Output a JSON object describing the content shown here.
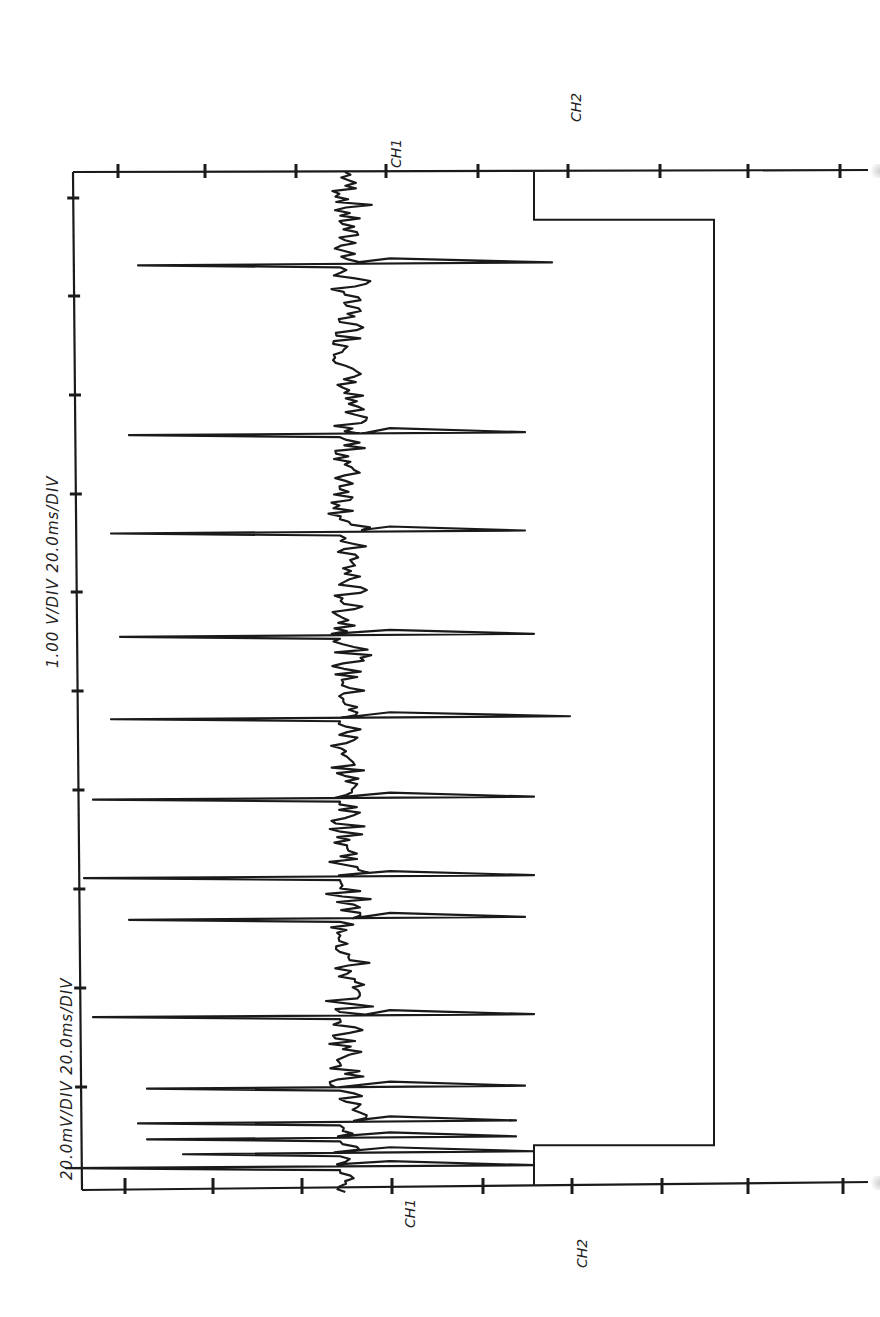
{
  "chart_data": {
    "type": "line",
    "title": "",
    "orientation": "rotated-90-ccw (time axis runs top to bottom)",
    "settings": [
      {
        "label": "20.0mV/DIV 20.0ms/DIV",
        "channel": "CH1",
        "volts_per_div": "20.0mV",
        "time_per_div": "20.0ms"
      },
      {
        "label": "1.00 V/DIV 20.0ms/DIV",
        "channel": "CH2",
        "volts_per_div": "1.00 V",
        "time_per_div": "20.0ms"
      }
    ],
    "channel_markers": {
      "top": [
        "CH1",
        "CH2"
      ],
      "bottom": [
        "CH1",
        "CH2"
      ]
    },
    "grid": false,
    "time_divisions": 10,
    "time_range_ms": [
      0,
      200
    ],
    "amplitude_divisions": 9,
    "series": [
      {
        "name": "CH1",
        "description": "Noisy baseline with repeated large biphasic spikes (bursts)",
        "baseline_division": 3.5,
        "spike_times_ms": [
          18.6,
          52.8,
          72.6,
          93.4,
          110.0,
          126.2,
          142.0,
          150.4,
          170.0,
          184.4,
          191.4,
          194.6,
          197.6,
          200.4
        ],
        "spike_min_div": [
          1.2,
          1.1,
          0.9,
          1.0,
          0.9,
          0.7,
          0.6,
          1.1,
          0.7,
          1.3,
          1.2,
          1.3,
          1.7,
          0.4
        ],
        "spike_max_div": [
          5.8,
          5.5,
          5.5,
          5.6,
          6.0,
          5.6,
          5.6,
          5.5,
          5.6,
          5.5,
          5.4,
          5.4,
          5.6,
          5.6
        ]
      },
      {
        "name": "CH2",
        "description": "Gate/trigger step signal",
        "levels_div": {
          "low": 5.6,
          "high": 7.6
        },
        "points": [
          {
            "t_ms": 0,
            "div": 5.6
          },
          {
            "t_ms": 9.6,
            "div": 5.6
          },
          {
            "t_ms": 9.6,
            "div": 7.6
          },
          {
            "t_ms": 196.0,
            "div": 7.6
          },
          {
            "t_ms": 196.0,
            "div": 5.6
          },
          {
            "t_ms": 204.0,
            "div": 5.6
          }
        ]
      }
    ]
  },
  "labels": {
    "ch1_setting": "20.0mV/DIV 20.0ms/DIV",
    "ch2_setting": "1.00 V/DIV 20.0ms/DIV",
    "ch1_top": "CH1",
    "ch2_top": "CH2",
    "ch1_bottom": "CH1",
    "ch2_bottom": "CH2"
  },
  "colors": {
    "ink": "#1a1a1a",
    "paper": "#ffffff"
  }
}
